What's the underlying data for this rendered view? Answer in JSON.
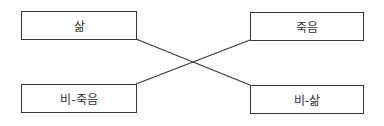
{
  "diagram": {
    "type": "chiasmus / semiotic square crossing",
    "nodes": {
      "top_left": {
        "label": "삶"
      },
      "top_right": {
        "label": "죽음"
      },
      "bottom_left": {
        "label": "비-죽음"
      },
      "bottom_right": {
        "label": "비-삶"
      }
    },
    "edges": [
      {
        "from": "top_left",
        "to": "bottom_right"
      },
      {
        "from": "bottom_left",
        "to": "top_right"
      }
    ],
    "colors": {
      "stroke": "#3a3a3a",
      "text": "#333333",
      "background": "#ffffff"
    }
  }
}
